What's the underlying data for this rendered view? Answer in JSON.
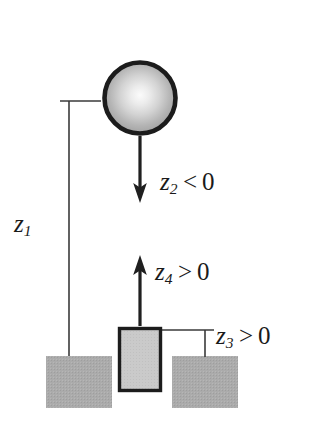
{
  "figure": {
    "type": "physics-schematic-diagram",
    "canvas": {
      "width": 311,
      "height": 424,
      "background": "#ffffff"
    },
    "colors": {
      "ink": "#1a1a1a",
      "outline": "#1f1f1f",
      "hatch_fill": "#a9a9a9",
      "block_fill": "#cccccc",
      "pulley_center": "#f2f2f2",
      "pulley_rim": "#9a9a9a",
      "rope": "#222222",
      "rope_slack": "#9b9b9b",
      "thin_rule": "#3a3a3a"
    },
    "labels": [
      {
        "id": "z1",
        "var": "z",
        "sub": "1",
        "rel": "",
        "value": "",
        "text": "z1",
        "x": 14,
        "y": 211
      },
      {
        "id": "z2",
        "var": "z",
        "sub": "2",
        "rel": "<",
        "value": "0",
        "text": "z2 < 0",
        "x": 160,
        "y": 169
      },
      {
        "id": "z4",
        "var": "z",
        "sub": "4",
        "rel": ">",
        "value": "0",
        "text": "z4 > 0",
        "x": 155,
        "y": 259
      },
      {
        "id": "z3",
        "var": "z",
        "sub": "3",
        "rel": ">",
        "value": "0",
        "text": "z3 > 0",
        "x": 216,
        "y": 323
      }
    ],
    "parts": {
      "pulley": {
        "name": "pulley-wheel",
        "cx": 140,
        "cy": 98,
        "r": 38,
        "rim_width": 5
      },
      "rope_top": {
        "name": "rope-above-pulley",
        "x": 140,
        "y1": 12,
        "y2": 60
      },
      "rope_main": {
        "name": "rope-below-pulley",
        "x": 140,
        "y1": 134,
        "y2": 327
      },
      "arrow_down": {
        "name": "arrow-z2-down",
        "x": 140,
        "tail_y": 140,
        "head_y": 200
      },
      "arrow_up": {
        "name": "arrow-z4-up",
        "x": 140,
        "tail_y": 320,
        "head_y": 258
      },
      "block": {
        "name": "hanging-block",
        "x": 118,
        "y": 327,
        "w": 44,
        "h": 65
      },
      "ground_left": {
        "name": "ground-left",
        "x": 46,
        "y": 356,
        "w": 66,
        "h": 52
      },
      "ground_right": {
        "name": "ground-right",
        "x": 172,
        "y": 356,
        "w": 66,
        "h": 52
      },
      "ground_notch": {
        "name": "ground-notch",
        "x": 108,
        "y": 356,
        "w": 65,
        "h": 52
      },
      "dim_z1": {
        "name": "dimension-line-z1",
        "x": 69,
        "y_top": 101,
        "y_bottom": 357,
        "tick_top_x1": 60,
        "tick_top_x2": 99,
        "tick_bottom_x1": 50,
        "tick_bottom_x2": 88
      },
      "dim_z3": {
        "name": "dimension-line-z3",
        "x": 205,
        "y_top": 330,
        "y_bottom": 357,
        "tick_top_x1": 160,
        "tick_top_x2": 213
      }
    }
  }
}
